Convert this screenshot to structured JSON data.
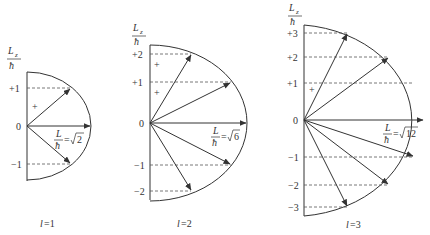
{
  "axis_label": {
    "numerator": "L",
    "subscript": "z",
    "denominator": "ħ"
  },
  "plus_sign": "+",
  "diagrams": [
    {
      "caption_var": "l",
      "caption_eq": "=1",
      "magnitude_label": {
        "lhs_num": "L",
        "lhs_den": "ħ",
        "eq": "=",
        "root": "2"
      },
      "ticks": [
        "+1",
        "0",
        "−1"
      ],
      "m_values": [
        1,
        0,
        -1
      ]
    },
    {
      "caption_var": "l",
      "caption_eq": "=2",
      "magnitude_label": {
        "lhs_num": "L",
        "lhs_den": "ħ",
        "eq": "=",
        "root": "6"
      },
      "ticks": [
        "+2",
        "+1",
        "0",
        "−1",
        "−2"
      ],
      "m_values": [
        2,
        1,
        0,
        -1,
        -2
      ]
    },
    {
      "caption_var": "l",
      "caption_eq": "=3",
      "magnitude_label": {
        "lhs_num": "L",
        "lhs_den": "ħ",
        "eq": "=",
        "root": "12"
      },
      "ticks": [
        "+3",
        "+2",
        "+1",
        "0",
        "−1",
        "−2",
        "−3"
      ],
      "m_values": [
        3,
        2,
        1,
        0,
        -1,
        -2,
        -3
      ]
    }
  ],
  "colors": {
    "line": "#333333",
    "dashed": "#555555",
    "background": "#ffffff"
  }
}
